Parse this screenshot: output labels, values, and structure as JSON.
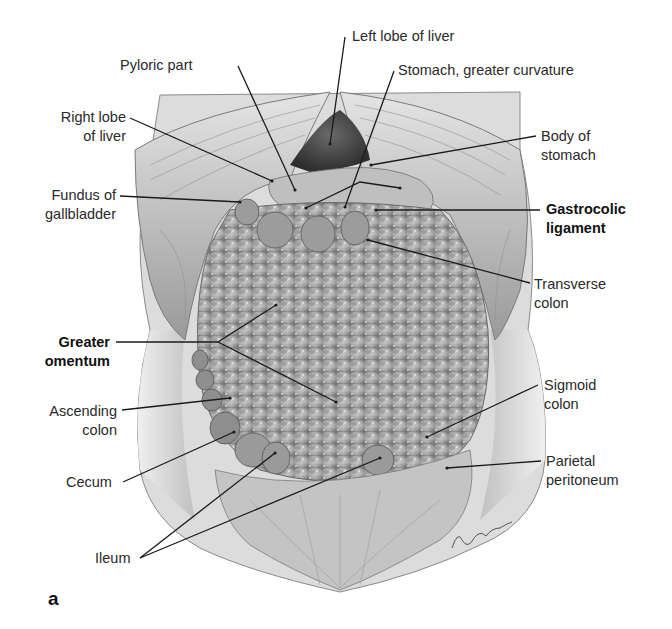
{
  "figure": {
    "panel_letter": "a",
    "signature": "Lepsius",
    "labels": {
      "left_lobe_of_liver": "Left lobe of liver",
      "pyloric_part": "Pyloric part",
      "stomach_greater_curvature": "Stomach, greater curvature",
      "right_lobe_of_liver_1": "Right lobe",
      "right_lobe_of_liver_2": "of liver",
      "body_of_stomach_1": "Body of",
      "body_of_stomach_2": "stomach",
      "fundus_of_gallbladder_1": "Fundus of",
      "fundus_of_gallbladder_2": "gallbladder",
      "gastrocolic_ligament_1": "Gastrocolic",
      "gastrocolic_ligament_2": "ligament",
      "transverse_colon_1": "Transverse",
      "transverse_colon_2": "colon",
      "greater_omentum_1": "Greater",
      "greater_omentum_2": "omentum",
      "ascending_colon_1": "Ascending",
      "ascending_colon_2": "colon",
      "sigmoid_colon_1": "Sigmoid",
      "sigmoid_colon_2": "colon",
      "cecum": "Cecum",
      "parietal_peritoneum_1": "Parietal",
      "parietal_peritoneum_2": "peritoneum",
      "ileum": "Ileum"
    },
    "colors": {
      "background": "#ffffff",
      "leader_line": "#1a1a1a",
      "tissue_light": "#d9d9d9",
      "tissue_mid": "#a8a8a8",
      "tissue_dark": "#555555"
    }
  }
}
